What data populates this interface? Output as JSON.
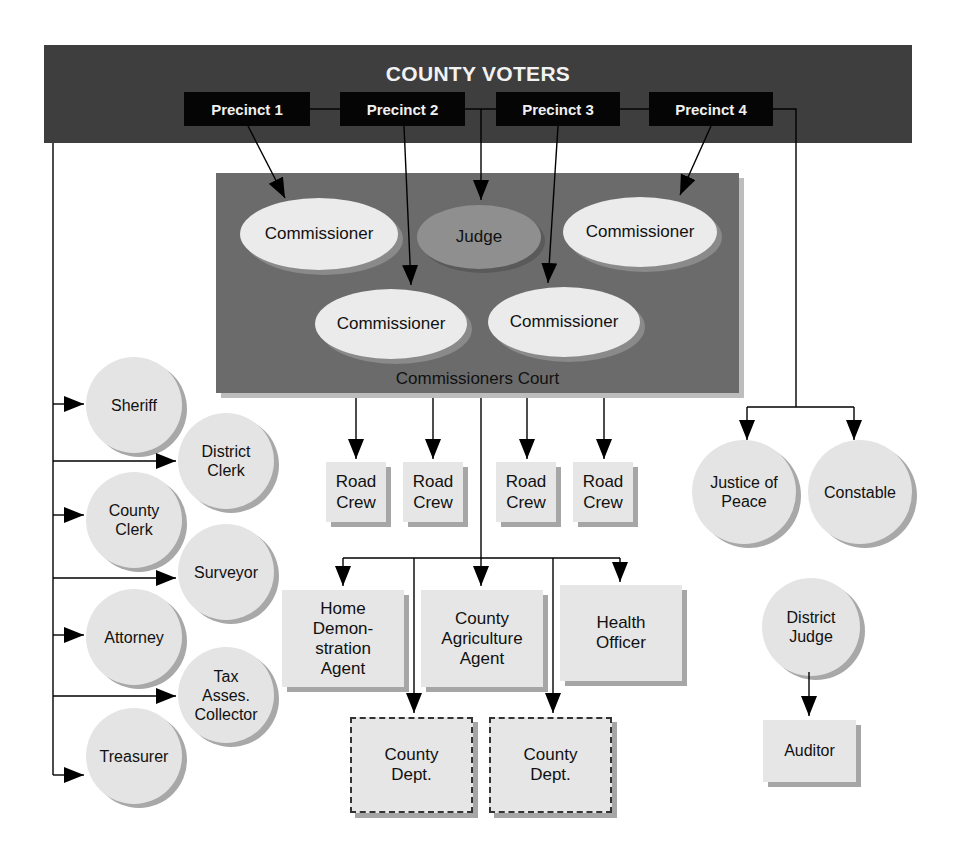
{
  "banner": {
    "title": "COUNTY VOTERS",
    "precincts": [
      {
        "label": "Precinct 1"
      },
      {
        "label": "Precinct 2"
      },
      {
        "label": "Precinct 3"
      },
      {
        "label": "Precinct 4"
      }
    ]
  },
  "court": {
    "label": "Commissioners Court",
    "members": [
      {
        "label": "Commissioner"
      },
      {
        "label": "Judge"
      },
      {
        "label": "Commissioner"
      },
      {
        "label": "Commissioner"
      },
      {
        "label": "Commissioner"
      }
    ]
  },
  "road_crews": [
    {
      "label": "Road\nCrew"
    },
    {
      "label": "Road\nCrew"
    },
    {
      "label": "Road\nCrew"
    },
    {
      "label": "Road\nCrew"
    }
  ],
  "elected_officials": [
    {
      "label": "Sheriff"
    },
    {
      "label": "District\nClerk"
    },
    {
      "label": "County\nClerk"
    },
    {
      "label": "Surveyor"
    },
    {
      "label": "Attorney"
    },
    {
      "label": "Tax\nAsses.\nCollector"
    },
    {
      "label": "Treasurer"
    }
  ],
  "agents": [
    {
      "label": "Home\nDemon-\nstration\nAgent"
    },
    {
      "label": "County\nAgriculture\nAgent"
    },
    {
      "label": "Health\nOfficer"
    }
  ],
  "county_depts": [
    {
      "label": "County\nDept."
    },
    {
      "label": "County\nDept."
    }
  ],
  "precinct_officials": [
    {
      "label": "Justice of\nPeace"
    },
    {
      "label": "Constable"
    }
  ],
  "district": {
    "judge": "District\nJudge",
    "auditor": "Auditor"
  },
  "colors": {
    "banner": "#3e3e3e",
    "precinct_box": "#050505",
    "court": "#6b6b6b",
    "node_fill": "#e6e6e6",
    "judge_fill": "#8f8f8f",
    "shadow": "#a6a6a6"
  }
}
